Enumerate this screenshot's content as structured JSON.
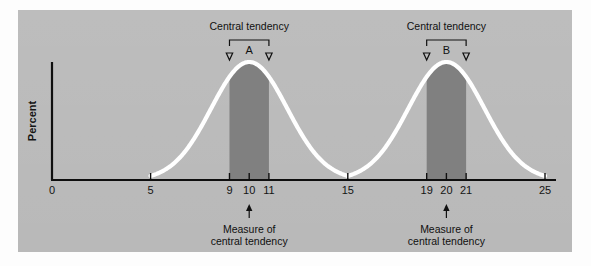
{
  "figure": {
    "panel_bg": "#b9b9b9",
    "curve_color": "#ffffff",
    "shade_color": "#808080",
    "axis_color": "#101010"
  },
  "chart_data": {
    "type": "line",
    "title": "",
    "subtitle": "",
    "xlabel": "",
    "ylabel": "Percent",
    "xlim": [
      0,
      25
    ],
    "ylim": [
      0,
      100
    ],
    "grid": false,
    "legend_position": "none",
    "x_ticks": [
      0,
      5,
      9,
      10,
      11,
      15,
      19,
      20,
      21,
      25
    ],
    "x_tick_labels": [
      "0",
      "5",
      "9",
      "10",
      "11",
      "15",
      "19",
      "20",
      "21",
      "25"
    ],
    "y_ticks": [],
    "y_tick_labels": [],
    "series": [
      {
        "name": "Distribution A",
        "type": "normal-curve",
        "mean": 10,
        "sigma": 1.93,
        "peak": 100,
        "x_start": 5,
        "x_end": 15
      },
      {
        "name": "Distribution B",
        "type": "normal-curve",
        "mean": 20,
        "sigma": 1.93,
        "peak": 100,
        "x_start": 15,
        "x_end": 25
      }
    ],
    "shaded_regions": [
      {
        "label": "A",
        "x_from": 9,
        "x_to": 11,
        "center": 10,
        "color": "#808080"
      },
      {
        "label": "B",
        "x_from": 19,
        "x_to": 21,
        "center": 20,
        "color": "#808080"
      }
    ],
    "annotations": [
      {
        "id": "bracket-a",
        "text": "Central tendency",
        "target_label": "A",
        "x_from": 9,
        "x_to": 11,
        "position": "top"
      },
      {
        "id": "bracket-b",
        "text": "Central tendency",
        "target_label": "B",
        "x_from": 19,
        "x_to": 21,
        "position": "top"
      },
      {
        "id": "caption-a",
        "line1": "Measure of",
        "line2": "central tendency",
        "x": 10,
        "position": "bottom"
      },
      {
        "id": "caption-b",
        "line1": "Measure of",
        "line2": "central tendency",
        "x": 20,
        "position": "bottom"
      }
    ]
  },
  "labels": {
    "y_axis": "Percent",
    "peak_a": "A",
    "peak_b": "B",
    "central_tendency": "Central tendency",
    "measure_line1": "Measure of",
    "measure_line2": "central tendency",
    "tick_0": "0",
    "tick_5": "5",
    "tick_9": "9",
    "tick_10": "10",
    "tick_11": "11",
    "tick_15": "15",
    "tick_19": "19",
    "tick_20": "20",
    "tick_21": "21",
    "tick_25": "25"
  }
}
